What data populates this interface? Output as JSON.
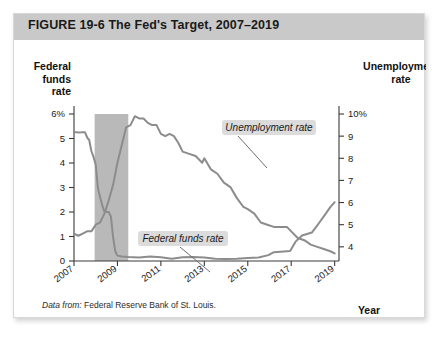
{
  "figure": {
    "title": "FIGURE  19-6   The Fed's Target, 2007–2019",
    "source_prefix": "Data from:",
    "source_text": " Federal Reserve Bank of St. Louis."
  },
  "colors": {
    "header_bar": "#c9c9c9",
    "line": "#8c8c8c",
    "recession_band": "#b9b9b9",
    "callout_bg": "#dcdcdc",
    "axis": "#3a3a3a"
  },
  "chart_data": {
    "type": "line",
    "title": "The Fed's Target, 2007–2019",
    "xlabel": "Year",
    "left_axis": {
      "label_line1": "Federal",
      "label_line2": "funds",
      "label_line3": "rate",
      "ticks": [
        "0",
        "1",
        "2",
        "3",
        "4",
        "5",
        "6%"
      ],
      "ylim": [
        0,
        6
      ]
    },
    "right_axis": {
      "label_line1": "Unemployment",
      "label_line2": "rate",
      "ticks": [
        "4",
        "5",
        "6",
        "7",
        "8",
        "9",
        "10%"
      ],
      "ylim": [
        3.36,
        10
      ]
    },
    "xlim": [
      2007,
      2019.2
    ],
    "xticks": [
      "2007",
      "2009",
      "2011",
      "2013",
      "2015",
      "2017",
      "2019"
    ],
    "xtick_values": [
      2007,
      2009,
      2011,
      2013,
      2015,
      2017,
      2019
    ],
    "grid": false,
    "legend": "annotations",
    "annotations": [
      {
        "label": "Unemployment rate",
        "x": 2011.9,
        "y_axis": "right"
      },
      {
        "label": "Federal funds rate",
        "x": 2010.4,
        "y_axis": "left"
      }
    ],
    "shaded_regions": [
      {
        "name": "recession",
        "x_start": 2007.95,
        "x_end": 2009.5
      }
    ],
    "series": [
      {
        "name": "Federal funds rate",
        "axis": "left",
        "unit": "percent",
        "x": [
          2007.0,
          2007.1,
          2007.2,
          2007.3,
          2007.4,
          2007.5,
          2007.62,
          2007.7,
          2007.8,
          2007.9,
          2008.0,
          2008.1,
          2008.2,
          2008.3,
          2008.4,
          2008.5,
          2008.6,
          2008.7,
          2008.8,
          2008.9,
          2009.0,
          2009.2,
          2009.5,
          2010.0,
          2010.5,
          2011.0,
          2011.5,
          2012.0,
          2012.5,
          2013.0,
          2013.5,
          2014.0,
          2014.5,
          2015.0,
          2015.5,
          2015.95,
          2016.2,
          2016.5,
          2016.95,
          2017.2,
          2017.5,
          2017.95,
          2018.2,
          2018.5,
          2018.8,
          2019.0
        ],
        "values": [
          5.26,
          5.26,
          5.25,
          5.25,
          5.26,
          5.26,
          5.02,
          4.94,
          4.49,
          4.24,
          3.94,
          2.98,
          2.61,
          2.28,
          2.01,
          2.0,
          2.0,
          1.81,
          0.97,
          0.39,
          0.22,
          0.18,
          0.16,
          0.14,
          0.18,
          0.15,
          0.09,
          0.15,
          0.16,
          0.14,
          0.09,
          0.08,
          0.09,
          0.12,
          0.14,
          0.24,
          0.36,
          0.38,
          0.41,
          0.79,
          1.04,
          1.16,
          1.45,
          1.82,
          2.2,
          2.4
        ]
      },
      {
        "name": "Unemployment rate",
        "axis": "right",
        "unit": "percent",
        "x": [
          2007.0,
          2007.2,
          2007.4,
          2007.6,
          2007.8,
          2008.0,
          2008.2,
          2008.4,
          2008.6,
          2008.8,
          2009.0,
          2009.2,
          2009.4,
          2009.6,
          2009.8,
          2010.0,
          2010.2,
          2010.4,
          2010.6,
          2010.8,
          2011.0,
          2011.2,
          2011.4,
          2011.6,
          2011.8,
          2012.0,
          2012.3,
          2012.6,
          2012.9,
          2013.0,
          2013.3,
          2013.6,
          2013.9,
          2014.2,
          2014.5,
          2014.8,
          2015.0,
          2015.3,
          2015.6,
          2015.9,
          2016.2,
          2016.5,
          2016.8,
          2017.0,
          2017.3,
          2017.6,
          2017.9,
          2018.2,
          2018.5,
          2018.8,
          2019.0
        ],
        "values": [
          4.6,
          4.5,
          4.6,
          4.7,
          4.7,
          5.0,
          5.1,
          5.5,
          6.1,
          6.8,
          7.8,
          8.6,
          9.4,
          9.5,
          9.9,
          9.8,
          9.8,
          9.6,
          9.5,
          9.5,
          9.1,
          9.0,
          9.1,
          9.0,
          8.7,
          8.3,
          8.2,
          8.1,
          7.8,
          8.0,
          7.5,
          7.3,
          6.9,
          6.7,
          6.2,
          5.8,
          5.7,
          5.5,
          5.1,
          5.0,
          4.9,
          4.9,
          4.9,
          4.7,
          4.4,
          4.3,
          4.1,
          4.0,
          3.9,
          3.8,
          3.7
        ]
      }
    ]
  }
}
